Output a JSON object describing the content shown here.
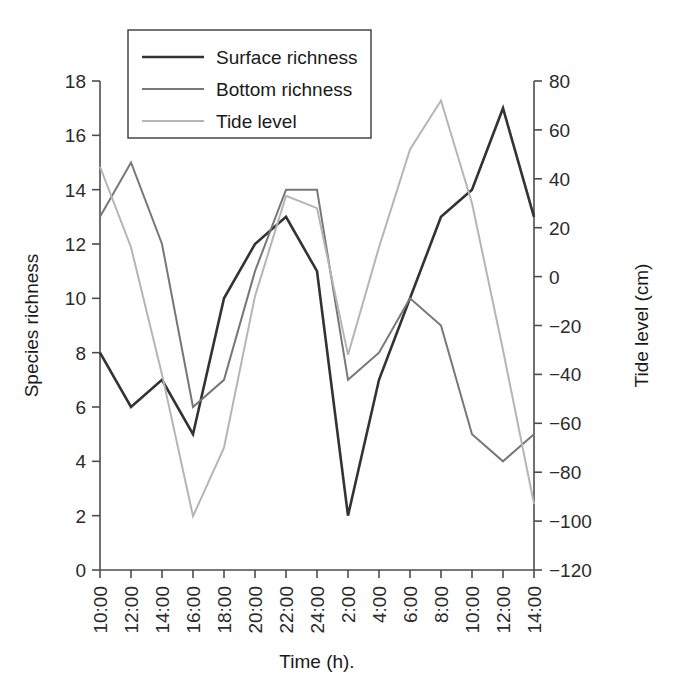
{
  "chart_data": {
    "type": "line",
    "title": "",
    "xlabel": "Time (h).",
    "ylabel": "Species richness",
    "y2label": "Tide level (cm)",
    "categories": [
      "10:00",
      "12:00",
      "14:00",
      "16:00",
      "18:00",
      "20:00",
      "22:00",
      "24:00",
      "2:00",
      "4:00",
      "6:00",
      "8:00",
      "10:00",
      "12:00",
      "14:00"
    ],
    "x_tick_labels": [
      "10:00",
      "12:00",
      "14:00",
      "16:00",
      "18:00",
      "20:00",
      "22:00",
      "24:00",
      "2:00",
      "4:00",
      "6:00",
      "8:00",
      "10:00",
      "12:00",
      "14:00"
    ],
    "ylim": [
      0,
      18
    ],
    "y_ticks": [
      0,
      2,
      4,
      6,
      8,
      10,
      12,
      14,
      16,
      18
    ],
    "y_tick_labels": [
      "0",
      "2",
      "4",
      "6",
      "8",
      "10",
      "12",
      "14",
      "16",
      "18"
    ],
    "y2lim": [
      -120,
      80
    ],
    "y2_ticks": [
      -120,
      -100,
      -80,
      -60,
      -40,
      -20,
      0,
      20,
      40,
      60,
      80
    ],
    "y2_tick_labels": [
      "−120",
      "−100",
      "−80",
      "−60",
      "−40",
      "−20",
      "0",
      "20",
      "40",
      "60",
      "80"
    ],
    "grid": false,
    "legend_position": "top-left",
    "series": [
      {
        "name": "Surface richness",
        "axis": "left",
        "color": "#333333",
        "width": 2.6,
        "values": [
          8,
          6,
          7,
          5,
          10,
          12,
          13,
          11,
          2,
          7,
          10,
          13,
          14,
          17,
          13
        ]
      },
      {
        "name": "Bottom richness",
        "axis": "left",
        "color": "#777777",
        "width": 2.0,
        "values": [
          13,
          15,
          12,
          6,
          7,
          11,
          14,
          14,
          7,
          8,
          10,
          9,
          5,
          4,
          5
        ]
      },
      {
        "name": "Tide level",
        "axis": "right",
        "color": "#b5b5b5",
        "width": 2.0,
        "values": [
          45,
          12,
          -40,
          -98,
          -70,
          -8,
          33,
          28,
          -32,
          12,
          52,
          72,
          30,
          -30,
          -93
        ]
      }
    ]
  },
  "legend": {
    "entries": [
      "Surface richness",
      "Bottom richness",
      "Tide level"
    ]
  }
}
